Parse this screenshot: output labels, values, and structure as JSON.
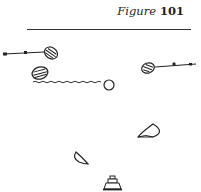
{
  "figure": {
    "label": "Figure",
    "number": "101"
  },
  "diagram": {
    "ink_color": "#222222",
    "elements": [
      {
        "type": "shot-line-with-ball",
        "name": "left-ball-with-trajectory"
      },
      {
        "type": "ball",
        "name": "left-lower-ball"
      },
      {
        "type": "wavy-line",
        "name": "wavy-path"
      },
      {
        "type": "ring",
        "name": "target-circle"
      },
      {
        "type": "shot-line-with-ball",
        "name": "right-ball-with-trajectory"
      },
      {
        "type": "half-disc",
        "name": "right-cup-marker"
      },
      {
        "type": "half-disc",
        "name": "left-cup-marker"
      },
      {
        "type": "post",
        "name": "bottom-post-marker"
      }
    ]
  }
}
